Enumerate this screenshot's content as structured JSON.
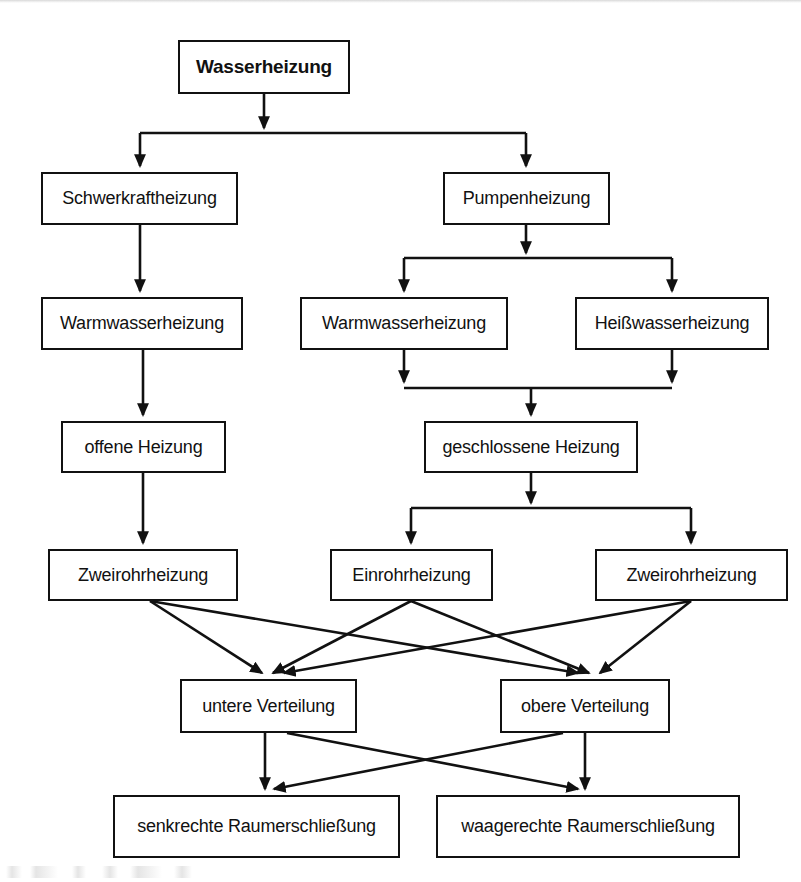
{
  "diagram": {
    "title": "Wasserheizung",
    "type": "flowchart",
    "orientation": "top-down",
    "background_color": "#ffffff",
    "line_color": "#111111",
    "text_color": "#111111",
    "nodes": [
      {
        "id": "wasserheizung",
        "label": "Wasserheizung",
        "level": 0,
        "bold": true,
        "x": 178,
        "y": 40,
        "w": 172,
        "h": 54
      },
      {
        "id": "schwerkraftheizung",
        "label": "Schwerkraftheizung",
        "level": 1,
        "bold": false,
        "x": 41,
        "y": 172,
        "w": 197,
        "h": 53
      },
      {
        "id": "pumpenheizung",
        "label": "Pumpenheizung",
        "level": 1,
        "bold": false,
        "x": 443,
        "y": 172,
        "w": 167,
        "h": 53
      },
      {
        "id": "warmwasser-links",
        "label": "Warmwasserheizung",
        "level": 2,
        "bold": false,
        "x": 41,
        "y": 297,
        "w": 202,
        "h": 53
      },
      {
        "id": "warmwasser-mitte",
        "label": "Warmwasserheizung",
        "level": 2,
        "bold": false,
        "x": 300,
        "y": 297,
        "w": 208,
        "h": 53
      },
      {
        "id": "heisswasser",
        "label": "Heißwasserheizung",
        "level": 2,
        "bold": false,
        "x": 575,
        "y": 297,
        "w": 194,
        "h": 53
      },
      {
        "id": "offene-heizung",
        "label": "offene Heizung",
        "level": 3,
        "bold": false,
        "x": 61,
        "y": 421,
        "w": 165,
        "h": 52
      },
      {
        "id": "geschlossene-heizung",
        "label": "geschlossene Heizung",
        "level": 3,
        "bold": false,
        "x": 424,
        "y": 421,
        "w": 214,
        "h": 52
      },
      {
        "id": "zweirohr-links",
        "label": "Zweirohrheizung",
        "level": 4,
        "bold": false,
        "x": 48,
        "y": 549,
        "w": 190,
        "h": 52
      },
      {
        "id": "einrohr",
        "label": "Einrohrheizung",
        "level": 4,
        "bold": false,
        "x": 330,
        "y": 549,
        "w": 163,
        "h": 52
      },
      {
        "id": "zweirohr-rechts",
        "label": "Zweirohrheizung",
        "level": 4,
        "bold": false,
        "x": 595,
        "y": 549,
        "w": 193,
        "h": 52
      },
      {
        "id": "untere-verteilung",
        "label": "untere Verteilung",
        "level": 5,
        "bold": false,
        "x": 180,
        "y": 679,
        "w": 177,
        "h": 54
      },
      {
        "id": "obere-verteilung",
        "label": "obere Verteilung",
        "level": 5,
        "bold": false,
        "x": 500,
        "y": 679,
        "w": 170,
        "h": 54
      },
      {
        "id": "senkrechte",
        "label": "senkrechte Raumerschließung",
        "level": 6,
        "bold": false,
        "x": 113,
        "y": 795,
        "w": 287,
        "h": 63
      },
      {
        "id": "waagerechte",
        "label": "waagerechte Raumerschließung",
        "level": 6,
        "bold": false,
        "x": 436,
        "y": 795,
        "w": 304,
        "h": 63
      }
    ],
    "edges": [
      {
        "from": "wasserheizung",
        "to": "schwerkraftheizung",
        "style": "orthogonal-split"
      },
      {
        "from": "wasserheizung",
        "to": "pumpenheizung",
        "style": "orthogonal-split"
      },
      {
        "from": "schwerkraftheizung",
        "to": "warmwasser-links",
        "style": "straight-vertical"
      },
      {
        "from": "pumpenheizung",
        "to": "warmwasser-mitte",
        "style": "orthogonal-split"
      },
      {
        "from": "pumpenheizung",
        "to": "heisswasser",
        "style": "orthogonal-split"
      },
      {
        "from": "warmwasser-links",
        "to": "offene-heizung",
        "style": "straight-vertical"
      },
      {
        "from": "warmwasser-mitte",
        "to": "geschlossene-heizung",
        "style": "orthogonal-merge"
      },
      {
        "from": "heisswasser",
        "to": "geschlossene-heizung",
        "style": "orthogonal-merge"
      },
      {
        "from": "offene-heizung",
        "to": "zweirohr-links",
        "style": "straight-vertical"
      },
      {
        "from": "geschlossene-heizung",
        "to": "einrohr",
        "style": "orthogonal-split"
      },
      {
        "from": "geschlossene-heizung",
        "to": "zweirohr-rechts",
        "style": "orthogonal-split"
      },
      {
        "from": "zweirohr-links",
        "to": "untere-verteilung",
        "style": "diagonal"
      },
      {
        "from": "zweirohr-links",
        "to": "obere-verteilung",
        "style": "diagonal"
      },
      {
        "from": "einrohr",
        "to": "untere-verteilung",
        "style": "diagonal"
      },
      {
        "from": "einrohr",
        "to": "obere-verteilung",
        "style": "diagonal"
      },
      {
        "from": "zweirohr-rechts",
        "to": "untere-verteilung",
        "style": "diagonal"
      },
      {
        "from": "zweirohr-rechts",
        "to": "obere-verteilung",
        "style": "diagonal"
      },
      {
        "from": "untere-verteilung",
        "to": "senkrechte",
        "style": "straight-vertical"
      },
      {
        "from": "untere-verteilung",
        "to": "waagerechte",
        "style": "diagonal"
      },
      {
        "from": "obere-verteilung",
        "to": "senkrechte",
        "style": "diagonal"
      },
      {
        "from": "obere-verteilung",
        "to": "waagerechte",
        "style": "straight-vertical"
      }
    ]
  }
}
